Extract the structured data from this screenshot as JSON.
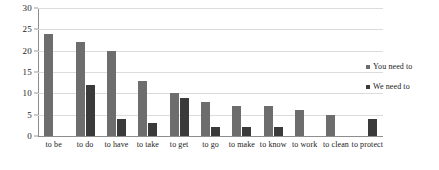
{
  "chart_data": {
    "type": "bar",
    "title": "",
    "subtitle": "",
    "xlabel": "",
    "ylabel": "",
    "ylim": [
      0,
      30
    ],
    "yticks": [
      0,
      5,
      10,
      15,
      20,
      25,
      30
    ],
    "grid": true,
    "legend_position": "right",
    "categories": [
      "to be",
      "to do",
      "to have",
      "to take",
      "to get",
      "to go",
      "to make",
      "to know",
      "to work",
      "to clean",
      "to protect"
    ],
    "series": [
      {
        "name": "You need to",
        "color": "#6d6d6d",
        "values": [
          24,
          22,
          20,
          13,
          10,
          8,
          7,
          7,
          6,
          5,
          0
        ]
      },
      {
        "name": "We need to",
        "color": "#3a3a3a",
        "values": [
          0,
          12,
          4,
          3,
          9,
          2,
          2,
          2,
          0,
          0,
          4
        ]
      }
    ]
  },
  "legend": {
    "items": [
      {
        "label": "You need to",
        "color": "#6d6d6d"
      },
      {
        "label": "We need to",
        "color": "#3a3a3a"
      }
    ]
  }
}
